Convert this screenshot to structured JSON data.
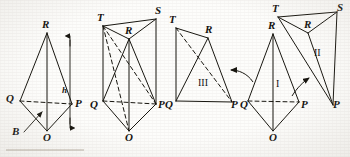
{
  "figure": {
    "stroke_color": "#17150f",
    "background_color": "#fdfdfb",
    "panels": [
      {
        "id": "panel-pyramid-h-b",
        "caption": "",
        "labels": [
          {
            "name": "apex-r",
            "text": "R"
          },
          {
            "name": "vertex-q",
            "text": "Q"
          },
          {
            "name": "vertex-p",
            "text": "P"
          },
          {
            "name": "vertex-o",
            "text": "O"
          },
          {
            "name": "height-h",
            "text": "h"
          },
          {
            "name": "base-b",
            "text": "B"
          }
        ]
      },
      {
        "id": "panel-prism",
        "caption": "",
        "labels": [
          {
            "name": "vertex-t",
            "text": "T"
          },
          {
            "name": "vertex-s",
            "text": "S"
          },
          {
            "name": "vertex-r",
            "text": "R"
          },
          {
            "name": "vertex-q",
            "text": "Q"
          },
          {
            "name": "vertex-p",
            "text": "P"
          },
          {
            "name": "vertex-o",
            "text": "O"
          }
        ]
      },
      {
        "id": "panel-piece-three",
        "caption": "III",
        "labels": [
          {
            "name": "vertex-t",
            "text": "T"
          },
          {
            "name": "vertex-r",
            "text": "R"
          },
          {
            "name": "vertex-q",
            "text": "Q"
          },
          {
            "name": "vertex-p",
            "text": "P"
          },
          {
            "name": "piece-number",
            "text": "III"
          }
        ]
      },
      {
        "id": "panel-piece-one",
        "caption": "I",
        "labels": [
          {
            "name": "apex-r",
            "text": "R"
          },
          {
            "name": "vertex-q",
            "text": "Q"
          },
          {
            "name": "vertex-p",
            "text": "P"
          },
          {
            "name": "vertex-o",
            "text": "O"
          },
          {
            "name": "piece-number",
            "text": "I"
          }
        ]
      },
      {
        "id": "panel-piece-two",
        "caption": "II",
        "labels": [
          {
            "name": "vertex-t",
            "text": "T"
          },
          {
            "name": "vertex-s",
            "text": "S"
          },
          {
            "name": "vertex-r",
            "text": "R"
          },
          {
            "name": "vertex-p",
            "text": "P"
          },
          {
            "name": "piece-number",
            "text": "II"
          }
        ]
      }
    ],
    "text_labels": {
      "r1": "R",
      "q1": "Q",
      "p1": "P",
      "o1": "O",
      "h1": "h",
      "b1": "B",
      "t2": "T",
      "s2": "S",
      "r2": "R",
      "q2": "Q",
      "p2": "P",
      "o2": "O",
      "t3": "T",
      "r3": "R",
      "q3": "Q",
      "p3": "P",
      "iii": "III",
      "r4": "R",
      "q4": "Q",
      "p4": "P",
      "o4": "O",
      "one": "I",
      "t5": "T",
      "s5": "S",
      "r5": "R",
      "p5": "P",
      "two": "II"
    }
  }
}
